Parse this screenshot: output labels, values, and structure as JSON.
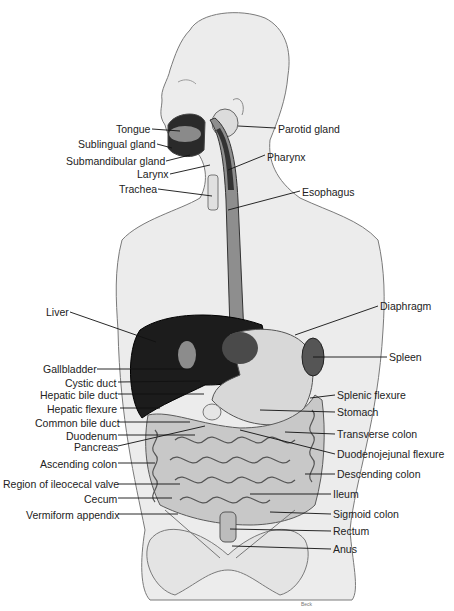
{
  "diagram": {
    "colors": {
      "outline": "#7a7a7a",
      "skin": "#ebebeb",
      "organ_dark": "#1a1a1a",
      "organ_mid": "#9a9a9a",
      "organ_light": "#d4d4d4",
      "label": "#222222"
    },
    "labels_left": [
      {
        "text": "Tongue",
        "x": 116,
        "y": 123
      },
      {
        "text": "Sublingual gland",
        "x": 78,
        "y": 138
      },
      {
        "text": "Submandibular gland",
        "x": 66,
        "y": 155
      },
      {
        "text": "Larynx",
        "x": 137,
        "y": 168
      },
      {
        "text": "Trachea",
        "x": 119,
        "y": 183
      },
      {
        "text": "Liver",
        "x": 46,
        "y": 306
      },
      {
        "text": "Gallbladder",
        "x": 43,
        "y": 363
      },
      {
        "text": "Cystic duct",
        "x": 65,
        "y": 377
      },
      {
        "text": "Hepatic bile duct",
        "x": 40,
        "y": 389
      },
      {
        "text": "Hepatic flexure",
        "x": 47,
        "y": 403
      },
      {
        "text": "Common bile duct",
        "x": 35,
        "y": 417
      },
      {
        "text": "Duodenum",
        "x": 66,
        "y": 430
      },
      {
        "text": "Pancreas",
        "x": 74,
        "y": 441
      },
      {
        "text": "Ascending colon",
        "x": 40,
        "y": 458
      },
      {
        "text": "Region of ileocecal valve",
        "x": 3,
        "y": 478
      },
      {
        "text": "Cecum",
        "x": 84,
        "y": 493
      },
      {
        "text": "Vermiform appendix",
        "x": 26,
        "y": 509
      }
    ],
    "labels_right": [
      {
        "text": "Parotid gland",
        "x": 278,
        "y": 123
      },
      {
        "text": "Pharynx",
        "x": 267,
        "y": 151
      },
      {
        "text": "Esophagus",
        "x": 302,
        "y": 186
      },
      {
        "text": "Diaphragm",
        "x": 380,
        "y": 300
      },
      {
        "text": "Spleen",
        "x": 389,
        "y": 351
      },
      {
        "text": "Splenic flexure",
        "x": 337,
        "y": 389
      },
      {
        "text": "Stomach",
        "x": 337,
        "y": 406
      },
      {
        "text": "Transverse colon",
        "x": 337,
        "y": 428
      },
      {
        "text": "Duodenojejunal flexure",
        "x": 337,
        "y": 448
      },
      {
        "text": "Descending colon",
        "x": 337,
        "y": 468
      },
      {
        "text": "Ileum",
        "x": 333,
        "y": 488
      },
      {
        "text": "Sigmoid colon",
        "x": 333,
        "y": 508
      },
      {
        "text": "Rectum",
        "x": 333,
        "y": 525
      },
      {
        "text": "Anus",
        "x": 333,
        "y": 543
      }
    ],
    "signature": "Beck"
  }
}
